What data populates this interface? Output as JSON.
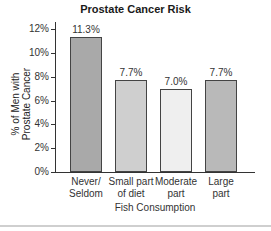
{
  "chart_data": {
    "type": "bar",
    "title": "Prostate Cancer Risk",
    "xlabel": "Fish Consumption",
    "ylabel": "% of Men with Prostate Cancer",
    "categories": [
      "Never/ Seldom",
      "Small part of diet",
      "Moderate part",
      "Large part"
    ],
    "values": [
      11.3,
      7.7,
      7.0,
      7.7
    ],
    "value_labels": [
      "11.3%",
      "7.7%",
      "7.0%",
      "7.7%"
    ],
    "bar_colors": [
      "#a9a9a9",
      "#cfcfcf",
      "#efefef",
      "#b9b9b9"
    ],
    "yticks": [
      "0%",
      "2%",
      "4%",
      "6%",
      "8%",
      "10%",
      "12%"
    ],
    "ylim": [
      0,
      12.5
    ],
    "grid": false,
    "legend": null
  },
  "labels": {
    "title": "Prostate Cancer Risk",
    "ylabel_line1": "% of Men with",
    "ylabel_line2": "Prostate Cancer",
    "xlabel": "Fish Consumption",
    "categories": [
      {
        "line1": "Never/",
        "line2": "Seldom"
      },
      {
        "line1": "Small part",
        "line2": "of diet"
      },
      {
        "line1": "Moderate",
        "line2": "part"
      },
      {
        "line1": "Large",
        "line2": "part"
      }
    ]
  }
}
